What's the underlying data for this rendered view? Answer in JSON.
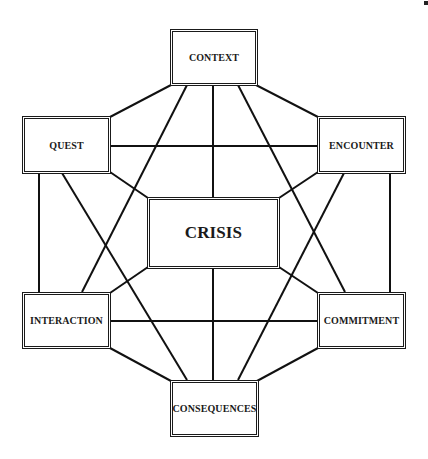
{
  "diagram": {
    "nodes": [
      {
        "id": "context",
        "label": "CONTEXT",
        "x": 170,
        "y": 29,
        "w": 88,
        "h": 57
      },
      {
        "id": "quest",
        "label": "QUEST",
        "x": 22,
        "y": 116,
        "w": 89,
        "h": 58
      },
      {
        "id": "encounter",
        "label": "ENCOUNTER",
        "x": 317,
        "y": 116,
        "w": 89,
        "h": 58
      },
      {
        "id": "crisis",
        "label": "CRISIS",
        "x": 147,
        "y": 197,
        "w": 133,
        "h": 72
      },
      {
        "id": "interaction",
        "label": "INTERACTION",
        "x": 22,
        "y": 292,
        "w": 89,
        "h": 57
      },
      {
        "id": "commitment",
        "label": "COMMITMENT",
        "x": 317,
        "y": 292,
        "w": 89,
        "h": 57
      },
      {
        "id": "consequences",
        "label": "CONSEQUENCES",
        "x": 170,
        "y": 380,
        "w": 89,
        "h": 57
      }
    ],
    "edges": [
      {
        "from": "context",
        "to": "quest",
        "x1": 171,
        "y1": 85,
        "x2": 110,
        "y2": 117
      },
      {
        "from": "context",
        "to": "encounter",
        "x1": 256,
        "y1": 85,
        "x2": 318,
        "y2": 117
      },
      {
        "from": "context",
        "to": "interaction",
        "x1": 187,
        "y1": 85,
        "x2": 82,
        "y2": 292
      },
      {
        "from": "context",
        "to": "crisis",
        "x1": 213,
        "y1": 85,
        "x2": 213,
        "y2": 197
      },
      {
        "from": "context",
        "to": "commitment",
        "x1": 238,
        "y1": 85,
        "x2": 345,
        "y2": 292
      },
      {
        "from": "quest",
        "to": "encounter",
        "x1": 110,
        "y1": 146,
        "x2": 317,
        "y2": 146
      },
      {
        "from": "quest",
        "to": "interaction",
        "x1": 39,
        "y1": 173,
        "x2": 39,
        "y2": 292
      },
      {
        "from": "quest",
        "to": "consequences",
        "x1": 62,
        "y1": 173,
        "x2": 187,
        "y2": 380
      },
      {
        "from": "quest",
        "to": "crisis",
        "x1": 110,
        "y1": 172,
        "x2": 148,
        "y2": 198
      },
      {
        "from": "encounter",
        "to": "commitment",
        "x1": 390,
        "y1": 173,
        "x2": 390,
        "y2": 292
      },
      {
        "from": "encounter",
        "to": "consequences",
        "x1": 344,
        "y1": 173,
        "x2": 238,
        "y2": 380
      },
      {
        "from": "encounter",
        "to": "crisis",
        "x1": 318,
        "y1": 172,
        "x2": 279,
        "y2": 198
      },
      {
        "from": "crisis",
        "to": "interaction",
        "x1": 148,
        "y1": 267,
        "x2": 110,
        "y2": 293
      },
      {
        "from": "crisis",
        "to": "commitment",
        "x1": 279,
        "y1": 267,
        "x2": 318,
        "y2": 293
      },
      {
        "from": "crisis",
        "to": "consequences",
        "x1": 213,
        "y1": 268,
        "x2": 213,
        "y2": 380
      },
      {
        "from": "interaction",
        "to": "commitment",
        "x1": 110,
        "y1": 321,
        "x2": 317,
        "y2": 321
      },
      {
        "from": "interaction",
        "to": "consequences",
        "x1": 110,
        "y1": 348,
        "x2": 171,
        "y2": 381
      },
      {
        "from": "commitment",
        "to": "consequences",
        "x1": 318,
        "y1": 348,
        "x2": 257,
        "y2": 381
      }
    ]
  }
}
